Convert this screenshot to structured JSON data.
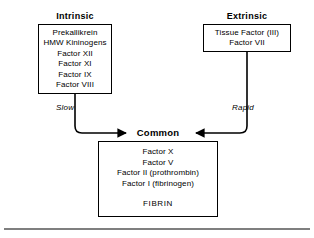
{
  "figure": {
    "stroke_color": "#000000",
    "background_color": "#ffffff"
  },
  "intrinsic": {
    "heading": "Intrinsic",
    "factors": [
      "Prekallikrein",
      "HMW Kininogens",
      "Factor XII",
      "Factor XI",
      "Factor IX",
      "Factor VIII"
    ],
    "edge_label": "Slow"
  },
  "extrinsic": {
    "heading": "Extrinsic",
    "factors": [
      "Tissue Factor (III)",
      "Factor VII"
    ],
    "edge_label": "Rapid"
  },
  "common": {
    "heading": "Common",
    "factors": [
      "Factor X",
      "Factor V",
      "Factor II (prothrombin)",
      "Factor I (fibrinogen)"
    ],
    "product": "FIBRIN"
  },
  "footer": {
    "rule": "horizontal-rule"
  }
}
